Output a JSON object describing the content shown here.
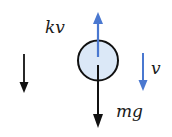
{
  "diagram": {
    "type": "free-body diagram",
    "body": {
      "shape": "circle",
      "fill": "#dbe8f7",
      "stroke": "#111111"
    },
    "forces": [
      {
        "name": "drag",
        "label": "kv",
        "direction": "up",
        "color": "#4a78d0"
      },
      {
        "name": "gravity",
        "label": "mg",
        "direction": "down",
        "color": "#111111"
      }
    ],
    "velocity": {
      "label": "v",
      "direction": "down",
      "color": "#4a78d0"
    },
    "reference_arrow": {
      "direction": "down",
      "color": "#111111"
    },
    "labels": {
      "drag": "kv",
      "gravity": "mg",
      "velocity": "v"
    }
  }
}
